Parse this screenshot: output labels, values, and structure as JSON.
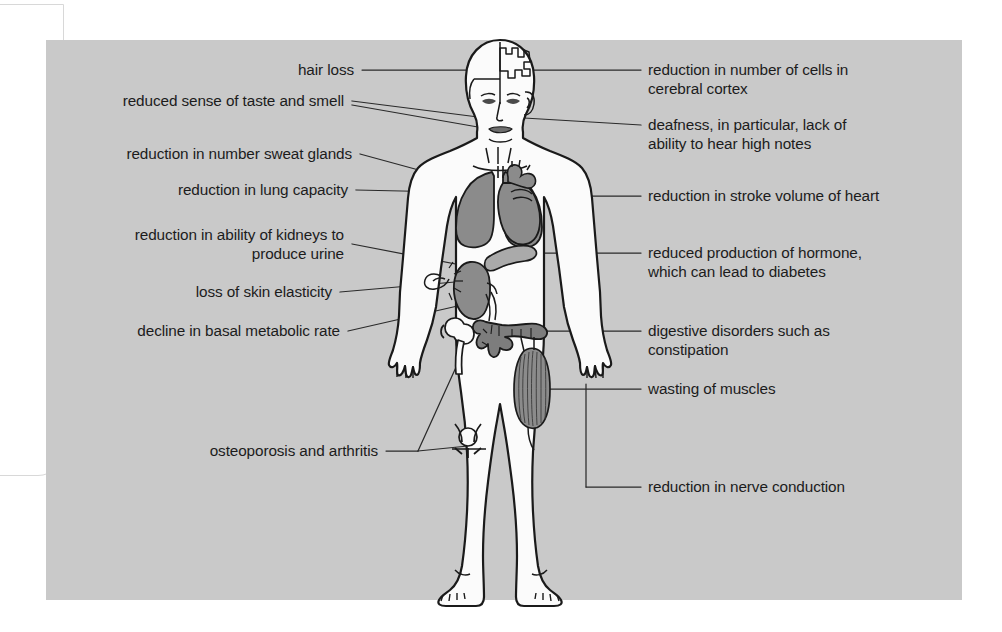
{
  "diagram": {
    "subject_name": "human-body-figure",
    "panel_color": "#c9c9c9",
    "body_fill": "#fbfbfb",
    "organ_fill": "#8b8b8b",
    "outline_color": "#1a1a1a",
    "leader_color": "#2a2a2a"
  },
  "labels_left": [
    {
      "id": "hair-loss",
      "text": "hair loss"
    },
    {
      "id": "taste-smell",
      "text": "reduced sense of taste and smell"
    },
    {
      "id": "sweat-glands",
      "text": "reduction in number sweat glands"
    },
    {
      "id": "lung-capacity",
      "text": "reduction in lung capacity"
    },
    {
      "id": "kidneys-urine",
      "text": "reduction in ability of kidneys to\nproduce urine"
    },
    {
      "id": "skin-elasticity",
      "text": "loss of skin elasticity"
    },
    {
      "id": "metabolic-rate",
      "text": "decline in basal metabolic rate"
    },
    {
      "id": "osteoporosis-arthritis",
      "text": "osteoporosis and arthritis"
    }
  ],
  "labels_right": [
    {
      "id": "cerebral-cortex",
      "text": "reduction in number of cells in\ncerebral cortex"
    },
    {
      "id": "deafness",
      "text": "deafness, in particular, lack of\nability to hear high notes"
    },
    {
      "id": "stroke-volume",
      "text": "reduction in stroke volume of heart"
    },
    {
      "id": "hormone-diabetes",
      "text": "reduced production of hormone,\nwhich can lead to diabetes"
    },
    {
      "id": "digestive-disorders",
      "text": "digestive disorders such as\nconstipation"
    },
    {
      "id": "wasting-muscles",
      "text": "wasting of muscles"
    },
    {
      "id": "nerve-conduction",
      "text": "reduction in nerve conduction"
    }
  ],
  "anatomy_parts": [
    {
      "id": "brain-cutaway",
      "name": "brain cutaway in skull"
    },
    {
      "id": "ear",
      "name": "ear"
    },
    {
      "id": "nose-mouth",
      "name": "nose and mouth"
    },
    {
      "id": "lungs",
      "name": "lungs"
    },
    {
      "id": "heart",
      "name": "heart"
    },
    {
      "id": "pancreas",
      "name": "pancreas"
    },
    {
      "id": "kidney",
      "name": "kidney with ureter"
    },
    {
      "id": "large-intestine",
      "name": "large intestine / colon"
    },
    {
      "id": "hip-joint",
      "name": "hip joint with femur head"
    },
    {
      "id": "knee-joint",
      "name": "knee joint"
    },
    {
      "id": "thigh-muscle",
      "name": "striated thigh muscle"
    },
    {
      "id": "skin-pinch",
      "name": "skin pinch marker on forearm"
    }
  ]
}
